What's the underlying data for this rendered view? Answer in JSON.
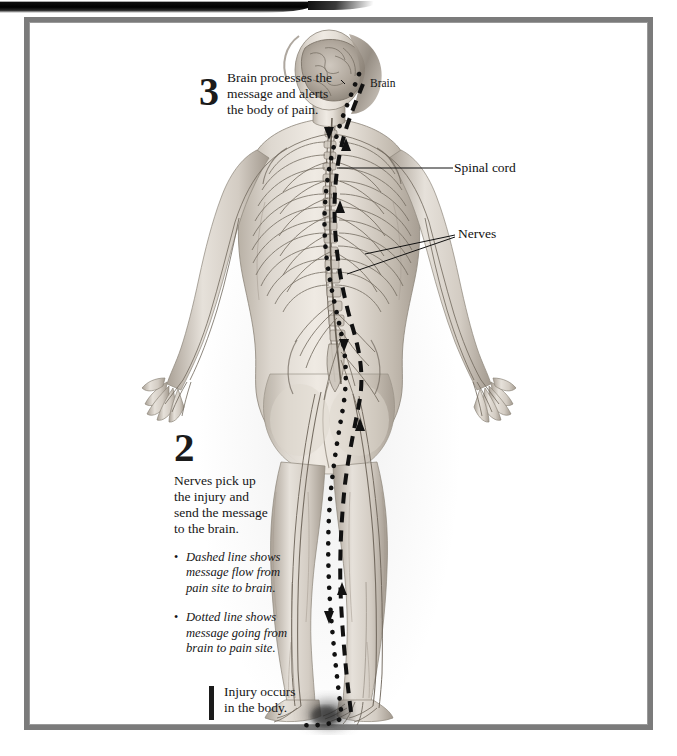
{
  "page": {
    "frame_color": "#7b7b7b",
    "background": "#ffffff"
  },
  "figure": {
    "view": "posterior",
    "illustration_style": "pencil-and-ink anatomical rendering"
  },
  "labels": {
    "brain": "Brain",
    "spinal_cord": "Spinal cord",
    "nerves": "Nerves"
  },
  "steps": [
    {
      "number": "1",
      "number_style": "bar",
      "text": "Injury occurs in the body.",
      "lines": [
        "Injury occurs",
        "in the body."
      ]
    },
    {
      "number": "2",
      "number_style": "numeral",
      "text": "Nerves pick up the injury and send the message to the brain.",
      "lines": [
        "Nerves pick up",
        "the injury and",
        "send the message",
        "to the brain."
      ],
      "bullets": [
        {
          "marker": "•",
          "text": "Dashed line shows message flow from pain site to brain.",
          "lines": [
            "Dashed line shows",
            "message flow from",
            "pain site to brain."
          ]
        },
        {
          "marker": "•",
          "text": "Dotted line shows message going from brain to pain site.",
          "lines": [
            "Dotted line shows",
            "message going from",
            "brain to pain site."
          ]
        }
      ]
    },
    {
      "number": "3",
      "number_style": "numeral",
      "text": "Brain processes the message and alerts the body of pain.",
      "lines": [
        "Brain processes the",
        "message and alerts",
        "the body of pain."
      ]
    }
  ],
  "legend": {
    "dashed_line": "message flow from pain site to brain",
    "dotted_line": "message going from brain to pain site"
  },
  "colors": {
    "ink": "#161616",
    "frame": "#7b7b7b",
    "skin_light": "#e9e4dd",
    "skin_mid": "#c9c2b8",
    "skin_shadow": "#9d958a",
    "nerve": "#6d6459",
    "path": "#111111"
  }
}
